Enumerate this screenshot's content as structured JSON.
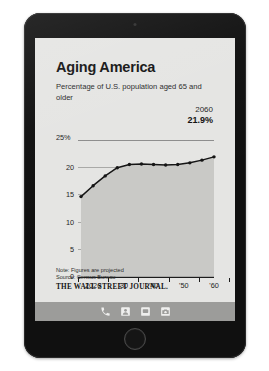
{
  "device": {
    "name": "tablet-device",
    "camera_icon": "camera-dot",
    "home_button_label": "Home",
    "dock": {
      "items": [
        {
          "icon": "phone-icon",
          "label": "Phone"
        },
        {
          "icon": "contacts-icon",
          "label": "Contacts"
        },
        {
          "icon": "messages-icon",
          "label": "Messages"
        },
        {
          "icon": "camera-icon",
          "label": "Camera"
        }
      ]
    }
  },
  "article": {
    "headline": "Aging America",
    "subtitle": "Percentage of U.S. population aged 65 and older",
    "callout": {
      "year": "2060",
      "value": "21.9%"
    },
    "note": "Note: Figures are projected",
    "source": "Source: Census Bureau",
    "publisher": "THE WALL STREET JOURNAL."
  },
  "chart_data": {
    "type": "line",
    "title": "Aging America",
    "subtitle": "Percentage of U.S. population aged 65 and older",
    "xlabel": "",
    "ylabel": "",
    "ylim": [
      0,
      25
    ],
    "xlim": [
      2015,
      2060
    ],
    "grid": true,
    "legend": false,
    "area_fill": true,
    "y_ticks": [
      "0",
      "5",
      "10",
      "15",
      "20",
      "25%"
    ],
    "y_tick_values": [
      0,
      5,
      10,
      15,
      20,
      25
    ],
    "x_ticks": [
      "2020",
      "'30",
      "'40",
      "'50",
      "'60"
    ],
    "x_tick_values": [
      2020,
      2030,
      2040,
      2050,
      2060
    ],
    "x": [
      2016,
      2020,
      2024,
      2028,
      2032,
      2036,
      2040,
      2044,
      2048,
      2052,
      2056,
      2060
    ],
    "values": [
      14.6,
      16.6,
      18.4,
      19.9,
      20.5,
      20.6,
      20.5,
      20.4,
      20.5,
      20.8,
      21.3,
      21.9
    ],
    "annotations": [
      {
        "x": 2060,
        "y": 21.9,
        "year_label": "2060",
        "value_label": "21.9%"
      }
    ],
    "note": "Note: Figures are projected",
    "source": "Source: Census Bureau",
    "line_color": "#141414",
    "fill_color": "#c9c9c6",
    "grid_color": "#a8a8a6",
    "background_color": "#e5e5e3"
  }
}
